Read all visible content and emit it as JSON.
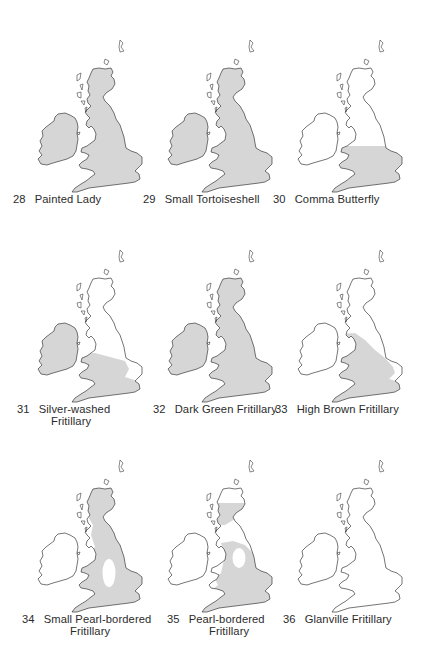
{
  "figure": {
    "shade_color": "#d6d6d6",
    "outline_color": "#3a3a3a",
    "background_color": "#ffffff"
  },
  "maps": [
    {
      "number": "28",
      "name": "Painted Lady",
      "name_line2": "",
      "distribution": "all of Britain and Ireland"
    },
    {
      "number": "29",
      "name": "Small Tortoiseshell",
      "name_line2": "",
      "distribution": "all of Britain and Ireland"
    },
    {
      "number": "30",
      "name": "Comma Butterfly",
      "name_line2": "",
      "distribution": "southern England and Wales"
    },
    {
      "number": "31",
      "name": "Silver-washed",
      "name_line2": "Fritillary",
      "distribution": "Ireland, Wales and southern England"
    },
    {
      "number": "32",
      "name": "Dark Green Fritillary",
      "name_line2": "",
      "distribution": "all of Britain and Ireland"
    },
    {
      "number": "33",
      "name": "High Brown Fritillary",
      "name_line2": "",
      "distribution": "England and Wales south of northern England"
    },
    {
      "number": "34",
      "name": "Small Pearl-bordered",
      "name_line2": "Fritillary",
      "distribution": "Scotland, England and Wales except the Midlands"
    },
    {
      "number": "35",
      "name": "Pearl-bordered",
      "name_line2": "Fritillary",
      "distribution": "Scottish Highlands, England and Wales except the Midlands"
    },
    {
      "number": "36",
      "name": "Glanville Fritillary",
      "name_line2": "",
      "distribution": "none shown (Isle of Wight only)"
    }
  ]
}
